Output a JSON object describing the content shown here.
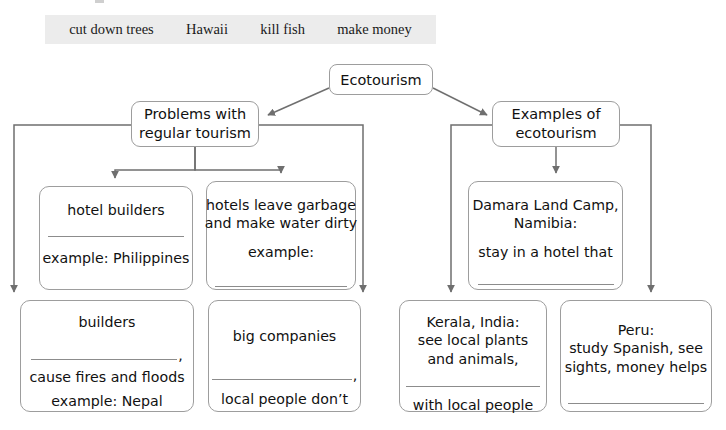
{
  "word_bank": {
    "name": "word-bank",
    "background_color": "#ececec",
    "items": [
      "cut down trees",
      "Hawaii",
      "kill fish",
      "make money"
    ]
  },
  "diagram": {
    "type": "hierarchy-flow-chart",
    "root": {
      "label": "Ecotourism"
    },
    "branches": [
      {
        "id": "problems",
        "title_line1": "Problems with",
        "title_line2": "regular tourism",
        "children": [
          {
            "id": "hotel-builders",
            "line1": "hotel builders",
            "blank_after_line1": true,
            "line2": "example: Philippines",
            "blank_after_line2": false
          },
          {
            "id": "hotels-garbage",
            "line1": "hotels leave garbage",
            "line2": "and make water dirty",
            "line3": "example:",
            "blank_after_line3": true
          },
          {
            "id": "builders",
            "line1": "builders",
            "blank_after_line1": true,
            "blank_trailing_punctuation": ",",
            "line2": "cause fires and floods",
            "line3": "example: Nepal"
          },
          {
            "id": "big-companies",
            "line1": "big companies",
            "blank_after_line1": true,
            "blank_trailing_punctuation": ",",
            "line2": "local people don’t"
          }
        ]
      },
      {
        "id": "examples",
        "title_line1": "Examples of",
        "title_line2": "ecotourism",
        "children": [
          {
            "id": "damara",
            "line1": "Damara Land Camp,",
            "line2": "Namibia:",
            "line3": "stay in a hotel that",
            "blank_after_line3": true
          },
          {
            "id": "kerala",
            "line1": "Kerala, India:",
            "line2": "see local plants",
            "line3": "and animals,",
            "blank_after_line3": true,
            "line4": "with local people"
          },
          {
            "id": "peru",
            "line1": "Peru:",
            "line2": "study Spanish, see",
            "line3": "sights, money helps",
            "blank_after_line3": true
          }
        ]
      }
    ]
  },
  "style": {
    "connector_color": "#6f6f6f",
    "box_border_color": "#9d9d9d",
    "text_color": "#111111",
    "blank_rule_color": "#8c8c8c",
    "page_background": "#ffffff"
  }
}
